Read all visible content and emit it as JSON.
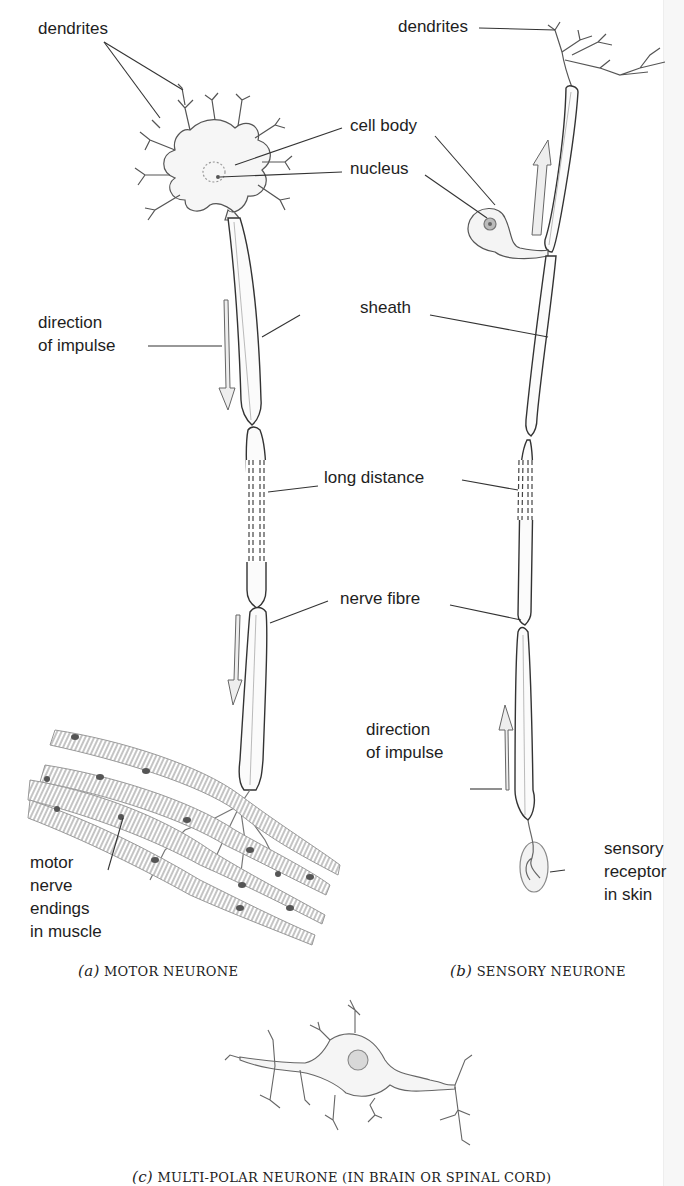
{
  "figure": {
    "panels": [
      {
        "id": "a",
        "caption_letter": "(a)",
        "caption_text": "MOTOR NEURONE",
        "labels": {
          "dendrites": "dendrites",
          "cell_body": "cell body",
          "nucleus": "nucleus",
          "sheath": "sheath",
          "direction_line1": "direction",
          "direction_line2": "of impulse",
          "long_distance": "long distance",
          "nerve_fibre": "nerve fibre",
          "motor_line1": "motor",
          "motor_line2": "nerve",
          "motor_line3": "endings",
          "motor_line4": "in muscle"
        }
      },
      {
        "id": "b",
        "caption_letter": "(b)",
        "caption_text": "SENSORY NEURONE",
        "labels": {
          "dendrites": "dendrites",
          "direction_line1": "direction",
          "direction_line2": "of impulse",
          "receptor_line1": "sensory",
          "receptor_line2": "receptor",
          "receptor_line3": "in skin"
        }
      },
      {
        "id": "c",
        "caption_letter": "(c)",
        "caption_text": "MULTI-POLAR NEURONE (IN BRAIN OR SPINAL CORD)"
      }
    ]
  }
}
